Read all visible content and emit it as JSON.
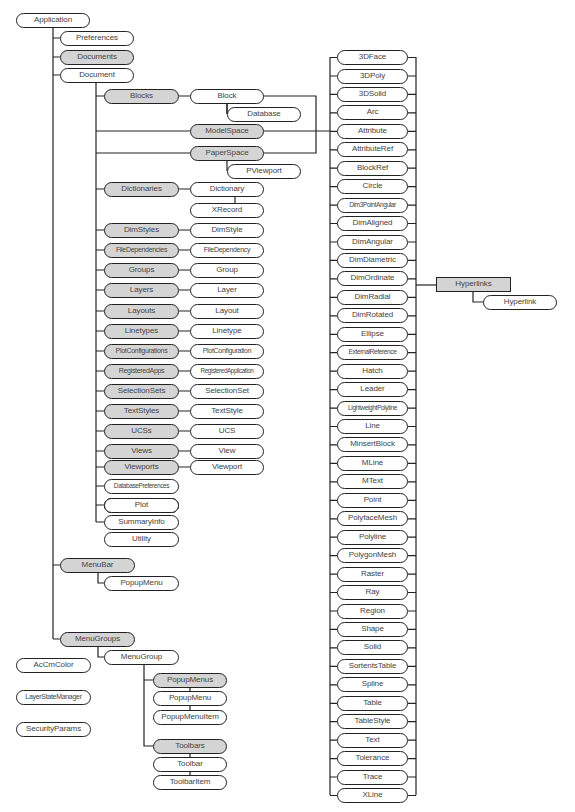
{
  "diagram": {
    "colors": {
      "collection_fill": "#d4d4d4",
      "object_fill": "#ffffff",
      "stroke": "#222222",
      "text": "#444444"
    },
    "root": {
      "label": "Application",
      "type": "object"
    },
    "application_children": [
      {
        "label": "Preferences",
        "type": "object"
      },
      {
        "label": "Documents",
        "type": "collection"
      },
      {
        "label": "Document",
        "type": "object"
      },
      {
        "label": "MenuBar",
        "type": "collection"
      },
      {
        "label": "PopupMenu",
        "type": "object"
      },
      {
        "label": "MenuGroups",
        "type": "collection"
      },
      {
        "label": "MenuGroup",
        "type": "object"
      },
      {
        "label": "PopupMenus",
        "type": "collection"
      },
      {
        "label": "PopupMenu",
        "type": "object"
      },
      {
        "label": "PopupMenuItem",
        "type": "object"
      },
      {
        "label": "Toolbars",
        "type": "collection"
      },
      {
        "label": "Toolbar",
        "type": "object"
      },
      {
        "label": "ToolbarItem",
        "type": "object"
      }
    ],
    "document_children": [
      {
        "collection": "Blocks",
        "object": "Block"
      },
      {
        "collection": "",
        "object": "Database"
      },
      {
        "collection": "ModelSpace",
        "object": ""
      },
      {
        "collection": "PaperSpace",
        "object": ""
      },
      {
        "collection": "",
        "object": "PViewport"
      },
      {
        "collection": "Dictionaries",
        "object": "Dictionary"
      },
      {
        "collection": "",
        "object": "XRecord"
      },
      {
        "collection": "DimStyles",
        "object": "DimStyle"
      },
      {
        "collection": "FileDependencies",
        "object": "FileDependency"
      },
      {
        "collection": "Groups",
        "object": "Group"
      },
      {
        "collection": "Layers",
        "object": "Layer"
      },
      {
        "collection": "Layouts",
        "object": "Layout"
      },
      {
        "collection": "Linetypes",
        "object": "Linetype"
      },
      {
        "collection": "PlotConfigurations",
        "object": "PlotConfiguration"
      },
      {
        "collection": "RegisteredApps",
        "object": "RegisteredApplication"
      },
      {
        "collection": "SelectionSets",
        "object": "SelectionSet"
      },
      {
        "collection": "TextStyles",
        "object": "TextStyle"
      },
      {
        "collection": "UCSs",
        "object": "UCS"
      },
      {
        "collection": "Views",
        "object": "View"
      },
      {
        "collection": "Viewports",
        "object": "Viewport"
      },
      {
        "collection": "",
        "object": "DatabasePreferences"
      },
      {
        "collection": "",
        "object": "Plot"
      },
      {
        "collection": "",
        "object": "SummaryInfo"
      },
      {
        "collection": "",
        "object": "Utility"
      }
    ],
    "entities": [
      "3DFace",
      "3DPoly",
      "3DSolid",
      "Arc",
      "Attribute",
      "AttributeRef",
      "BlockRef",
      "Circle",
      "Dim3PointAngular",
      "DimAligned",
      "DimAngular",
      "DimDiametric",
      "DimOrdinate",
      "DimRadial",
      "DimRotated",
      "Ellipse",
      "ExternalReference",
      "Hatch",
      "Leader",
      "LightweightPolyline",
      "Line",
      "MinsertBlock",
      "MLine",
      "MText",
      "Point",
      "PolyfaceMesh",
      "Polyline",
      "PolygonMesh",
      "Raster",
      "Ray",
      "Region",
      "Shape",
      "Solid",
      "SortentsTable",
      "Spline",
      "Table",
      "TableStyle",
      "Text",
      "Tolerance",
      "Trace",
      "XLine"
    ],
    "entity_extras": {
      "collection": "Hyperlinks",
      "object": "Hyperlink"
    },
    "standalone": [
      "AcCmColor",
      "LayerStateManager",
      "SecurityParams"
    ]
  }
}
